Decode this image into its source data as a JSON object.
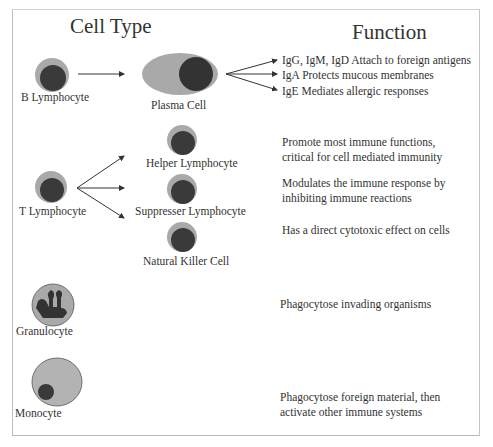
{
  "headings": {
    "cell_type": "Cell Type",
    "function": "Function"
  },
  "colors": {
    "cytoplasm": "#a9a9a9",
    "nucleus": "#3a3a3a",
    "monocyte_cytoplasm": "#b3b3b3",
    "arrow": "#333333",
    "frame": "#c0c0c0"
  },
  "cells": {
    "b_lymphocyte": "B Lymphocyte",
    "plasma_cell": "Plasma Cell",
    "t_lymphocyte": "T Lymphocyte",
    "helper": "Helper Lymphocyte",
    "suppresser": "Suppresser Lymphocyte",
    "nk": "Natural Killer Cell",
    "granulocyte": "Granulocyte",
    "monocyte": "Monocyte"
  },
  "functions": {
    "igg": "IgG, IgM, IgD   Attach to foreign antigens",
    "iga": "IgA  Protects mucous membranes",
    "ige": "IgE Mediates allergic responses",
    "helper_l1": "Promote most immune functions,",
    "helper_l2": "critical for cell mediated immunity",
    "suppresser_l1": "Modulates the immune response by",
    "suppresser_l2": "inhibiting immune reactions",
    "nk": "Has a direct cytotoxic effect on cells",
    "granulocyte": "Phagocytose invading organisms",
    "monocyte_l1": "Phagocytose foreign material, then",
    "monocyte_l2": "activate other immune systems"
  }
}
